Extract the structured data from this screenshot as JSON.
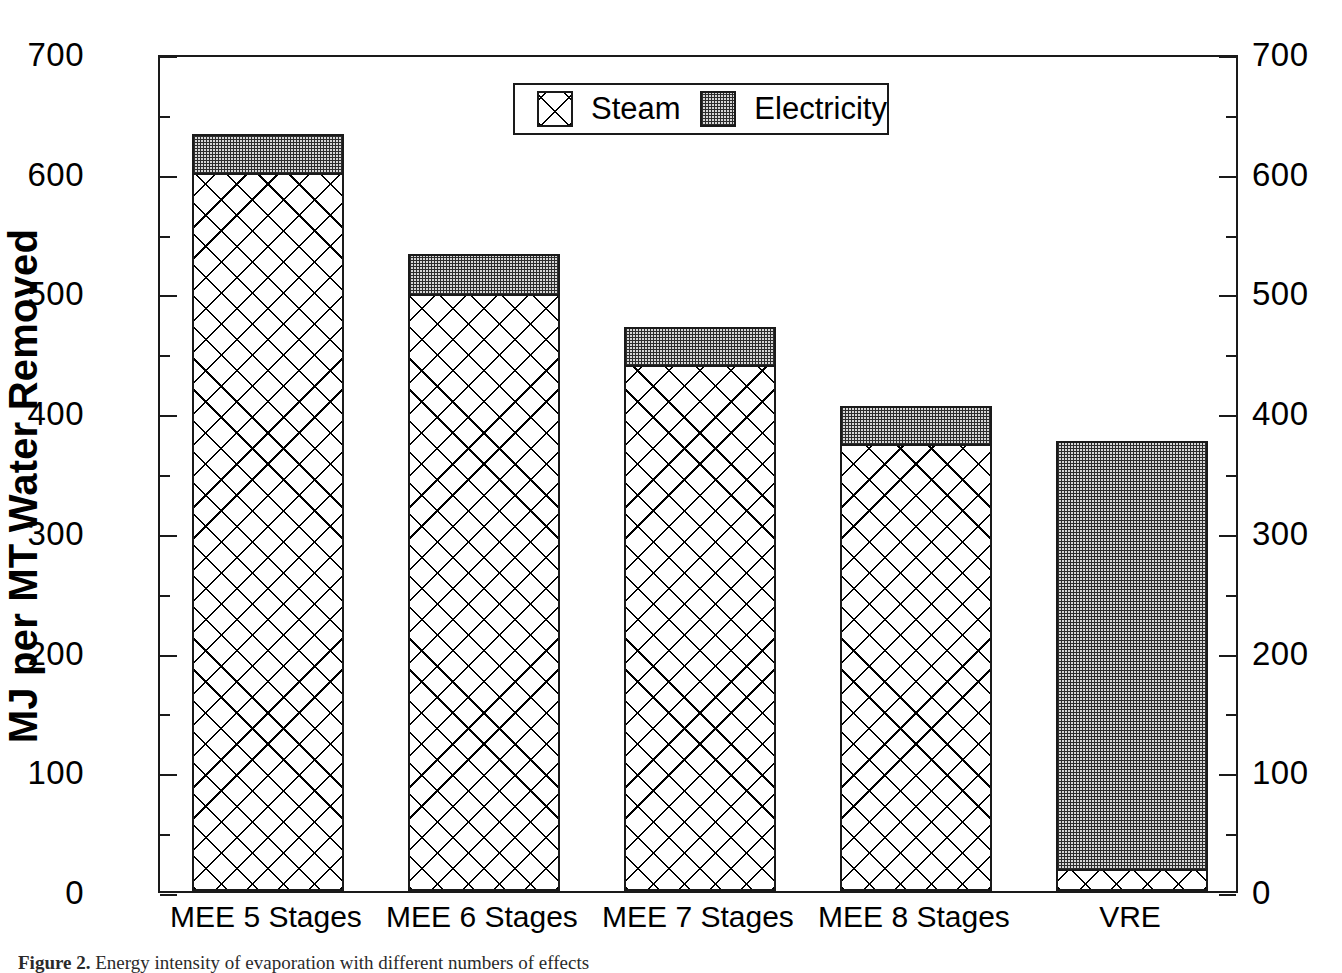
{
  "chart_data": {
    "type": "bar",
    "subtype": "stacked-bar",
    "title": "",
    "xlabel": "",
    "ylabel": "MJ per MT Water Removed",
    "ylim": [
      0,
      700
    ],
    "ytick_step": 100,
    "yminor_step": 50,
    "grid": false,
    "dual_axis": true,
    "legend_position": "top-center",
    "categories": [
      "MEE 5 Stages",
      "MEE 6 Stages",
      "MEE 7 Stages",
      "MEE 8 Stages",
      "VRE"
    ],
    "yticks": [
      "0",
      "100",
      "200",
      "300",
      "400",
      "500",
      "600",
      "700"
    ],
    "yticks_right": [
      "0",
      "100",
      "200",
      "300",
      "400",
      "500",
      "600",
      "700"
    ],
    "series": [
      {
        "name": "Steam",
        "pattern": "crosshatch",
        "color": "#ffffff",
        "values": [
          598,
          497,
          438,
          372,
          17
        ]
      },
      {
        "name": "Electricity",
        "pattern": "stipple",
        "color": "#d6d6d6",
        "values": [
          34,
          35,
          33,
          33,
          359
        ]
      }
    ],
    "totals": [
      632,
      532,
      471,
      405,
      376
    ]
  },
  "legend": {
    "items": [
      {
        "label": "Steam",
        "swatch": "crosshatch-swatch"
      },
      {
        "label": "Electricity",
        "swatch": "stipple-swatch"
      }
    ]
  },
  "caption": {
    "figure_label": "Figure 2.",
    "text": "Energy intensity of evaporation with different numbers of effects"
  },
  "colors": {
    "axis": "#1a1a1a",
    "steam_fill": "#ffffff",
    "electricity_fill": "#d6d6d6",
    "background": "#ffffff"
  }
}
